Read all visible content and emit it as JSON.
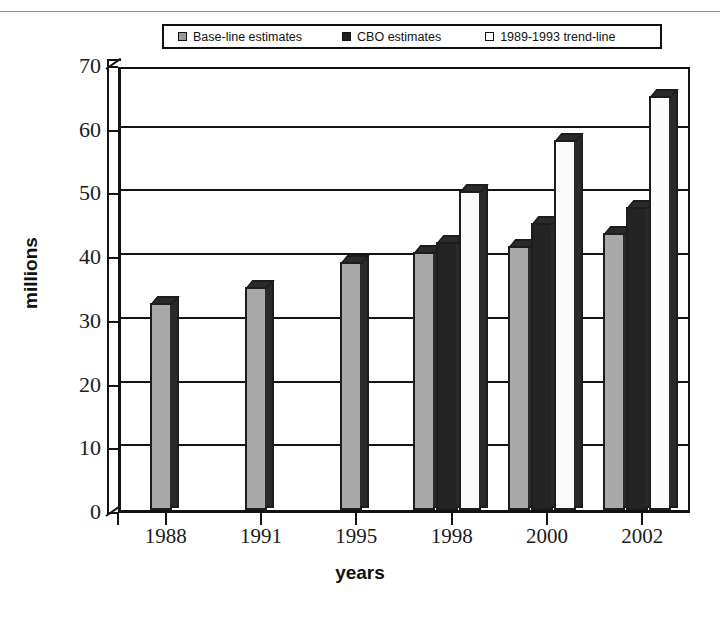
{
  "chart_data": {
    "type": "bar",
    "title": "",
    "xlabel": "years",
    "ylabel": "millions",
    "categories": [
      "1988",
      "1991",
      "1995",
      "1998",
      "2000",
      "2002"
    ],
    "series": [
      {
        "name": "Base-line  estimates",
        "key": "baseline",
        "color": "#a9a9a9",
        "values": [
          32.5,
          35,
          39,
          40.5,
          41.5,
          43.5
        ]
      },
      {
        "name": "CBO estimates",
        "key": "cbo",
        "color": "#242424",
        "values": [
          null,
          null,
          null,
          42,
          45,
          47.5
        ]
      },
      {
        "name": "1989-1993  trend-line",
        "key": "trend",
        "color": "#fbfbfb",
        "values": [
          null,
          null,
          null,
          50,
          58,
          65
        ]
      }
    ],
    "ylim": [
      0,
      70
    ],
    "ytick_values": [
      0,
      10,
      20,
      30,
      40,
      50,
      60,
      70
    ],
    "ytick_labels": [
      "0",
      "10",
      "20",
      "30",
      "40",
      "50",
      "60",
      "70"
    ],
    "grid": true,
    "legend_position": "top-center",
    "style": "3d-column"
  },
  "legend": {
    "items": [
      {
        "label": "Base-line  estimates",
        "swatch": "baseline-swatch"
      },
      {
        "label": "CBO estimates",
        "swatch": "cbo-swatch"
      },
      {
        "label": "1989-1993  trend-line",
        "swatch": "trend-swatch"
      }
    ]
  },
  "axes": {
    "y_title": "millions",
    "x_title": "years"
  }
}
